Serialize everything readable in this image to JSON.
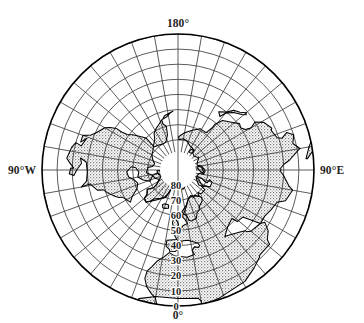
{
  "figure": {
    "title": "",
    "projection_label": "polar-azimuthal-equidistant",
    "caption": ""
  },
  "chart_data": {
    "type": "map",
    "title": "",
    "subtitle": "",
    "projection": "azimuthal equidistant, north polar aspect",
    "center": {
      "lat": 90,
      "lon": 0
    },
    "outer_boundary_lat": 0,
    "grid": true,
    "grid_spacing": {
      "parallels_deg": 10,
      "meridians_deg": 10
    },
    "meridian_labels": [
      {
        "text": "180°",
        "lon": 180,
        "position": "top"
      },
      {
        "text": "90°W",
        "lon": -90,
        "position": "left"
      },
      {
        "text": "90°E",
        "lon": 90,
        "position": "right"
      },
      {
        "text": "0°",
        "lon": 0,
        "position": "bottom"
      }
    ],
    "parallel_labels": [
      {
        "text": "80",
        "lat": 80
      },
      {
        "text": "70",
        "lat": 70
      },
      {
        "text": "60",
        "lat": 60
      },
      {
        "text": "50",
        "lat": 50
      },
      {
        "text": "40",
        "lat": 40
      },
      {
        "text": "30",
        "lat": 30
      },
      {
        "text": "20",
        "lat": 20
      },
      {
        "text": "10",
        "lat": 10
      },
      {
        "text": "0",
        "lat": 0
      }
    ],
    "xlabel": "",
    "ylabel": "",
    "legend": [],
    "series": [
      {
        "name": "land",
        "fill": "stippled-gray",
        "values": []
      },
      {
        "name": "ocean",
        "fill": "white",
        "values": []
      }
    ],
    "colors": {
      "land_fill": "#c9c9c9",
      "ocean_fill": "#ffffff",
      "coastline": "#000000",
      "graticule": "#3d3d3d",
      "boundary": "#000000",
      "label": "#262626"
    }
  },
  "geometry": {
    "center_x": 178,
    "center_y": 170,
    "radius": 136,
    "inner_hole_radius": 18
  }
}
